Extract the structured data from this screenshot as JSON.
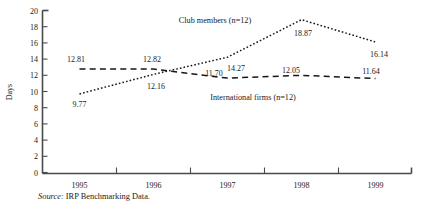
{
  "figure": {
    "source_prefix": "Source:",
    "source_text": "IRP Benchmarking Data."
  },
  "chart_data": {
    "type": "line",
    "title": "",
    "xlabel": "",
    "ylabel": "Days",
    "ylim": [
      0,
      20
    ],
    "ytick_step": 2,
    "yticks": [
      "0",
      "2",
      "4",
      "6",
      "8",
      "10",
      "12",
      "14",
      "16",
      "18",
      "20"
    ],
    "grid": false,
    "legend_position": "inline-annotations",
    "categories": [
      "1995",
      "1996",
      "1997",
      "1998",
      "1999"
    ],
    "series": [
      {
        "name": "Club members (n=12)",
        "style": "dotted",
        "color": "#171717",
        "values": [
          9.77,
          12.16,
          14.27,
          18.87,
          16.14
        ],
        "labels": [
          "9.77",
          "12.16",
          "14.27",
          "18.87",
          "16.14"
        ]
      },
      {
        "name": "International firms (n=12)",
        "style": "dashed",
        "color": "#171717",
        "values": [
          12.81,
          12.82,
          11.7,
          12.05,
          11.64
        ],
        "labels": [
          "12.81",
          "12.82",
          "11.70",
          "12.05",
          "11.64"
        ]
      }
    ]
  }
}
